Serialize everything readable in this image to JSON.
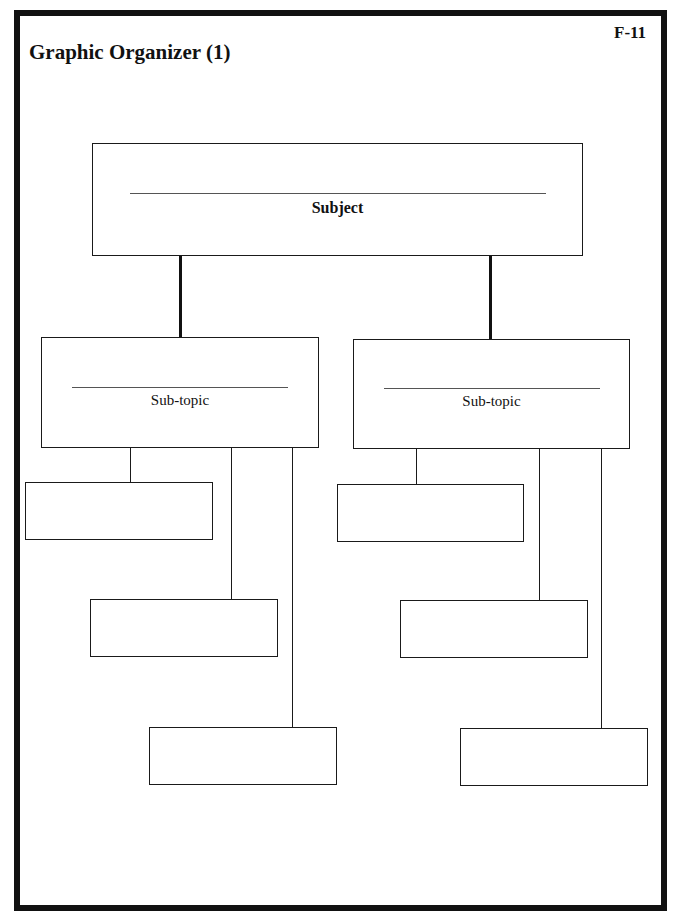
{
  "page": {
    "title": "Graphic Organizer (1)",
    "code": "F-11"
  },
  "organizer": {
    "subject": {
      "label": "Subject",
      "answer": ""
    },
    "subtopics": [
      {
        "label": "Sub-topic",
        "answer": "",
        "details": [
          "",
          "",
          ""
        ]
      },
      {
        "label": "Sub-topic",
        "answer": "",
        "details": [
          "",
          "",
          ""
        ]
      }
    ]
  }
}
